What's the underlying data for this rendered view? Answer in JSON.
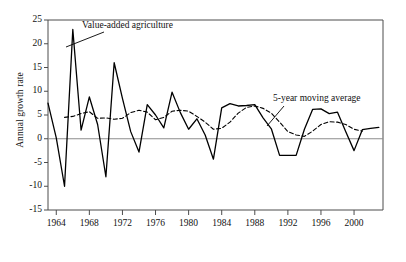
{
  "chart_data": {
    "type": "line",
    "title": "",
    "xlabel": "",
    "ylabel": "Annual growth rate",
    "xlim": [
      1963,
      2003.5
    ],
    "ylim": [
      -15,
      25
    ],
    "yticks": [
      25,
      20,
      15,
      10,
      5,
      0,
      -5,
      -10,
      -15
    ],
    "xticks": [
      1964,
      1968,
      1972,
      1976,
      1980,
      1984,
      1988,
      1992,
      1996,
      2000
    ],
    "grid": false,
    "legend_position": "inline-annotations",
    "zero_line": 0,
    "annotations": [
      {
        "text": "Value-added agriculture",
        "x": 1969.2,
        "y": 21.0
      },
      {
        "text": "5-year moving average",
        "x": 1992.5,
        "y": 9.8
      }
    ],
    "series": [
      {
        "name": "Value-added agriculture",
        "style": "solid",
        "color": "#000000",
        "x": [
          1963,
          1964,
          1965,
          1966,
          1967,
          1968,
          1969,
          1970,
          1971,
          1972,
          1973,
          1974,
          1975,
          1976,
          1977,
          1978,
          1979,
          1980,
          1981,
          1982,
          1983,
          1984,
          1985,
          1986,
          1987,
          1988,
          1989,
          1990,
          1991,
          1992,
          1993,
          1994,
          1995,
          1996,
          1997,
          1998,
          1999,
          2000,
          2001,
          2002,
          2003
        ],
        "y": [
          7.5,
          0.2,
          -10.0,
          23.0,
          1.8,
          8.8,
          3.0,
          -8.0,
          16.0,
          8.5,
          1.5,
          -2.8,
          7.2,
          5.0,
          2.3,
          9.8,
          5.5,
          2.0,
          4.2,
          0.8,
          -4.3,
          6.5,
          7.4,
          6.9,
          7.0,
          7.2,
          4.4,
          2.1,
          -3.5,
          -3.5,
          -3.5,
          2.0,
          6.2,
          6.3,
          5.3,
          5.6,
          1.5,
          -2.5,
          1.9,
          2.2,
          2.4
        ]
      },
      {
        "name": "5-year moving average",
        "style": "dashed",
        "color": "#000000",
        "x": [
          1965,
          1966,
          1967,
          1968,
          1969,
          1970,
          1971,
          1972,
          1973,
          1974,
          1975,
          1976,
          1977,
          1978,
          1979,
          1980,
          1981,
          1982,
          1983,
          1984,
          1985,
          1986,
          1987,
          1988,
          1989,
          1990,
          1991,
          1992,
          1993,
          1994,
          1995,
          1996,
          1997,
          1998,
          1999,
          2000,
          2001
        ],
        "y": [
          4.5,
          4.7,
          5.3,
          5.7,
          4.3,
          4.4,
          4.1,
          4.3,
          5.5,
          6.0,
          5.6,
          4.0,
          4.5,
          5.8,
          6.0,
          5.8,
          4.7,
          3.5,
          2.0,
          2.2,
          3.5,
          5.4,
          6.6,
          6.9,
          6.4,
          5.4,
          3.5,
          1.5,
          0.8,
          0.5,
          1.6,
          3.0,
          3.6,
          3.5,
          3.0,
          2.0,
          1.6
        ]
      }
    ]
  },
  "axis": {
    "ylabel": "Annual growth rate",
    "ytick_labels": [
      "25",
      "20",
      "15",
      "10",
      "5",
      "0",
      "-5",
      "-10",
      "-15"
    ],
    "xtick_labels": [
      "1964",
      "1968",
      "1972",
      "1976",
      "1980",
      "1984",
      "1988",
      "1992",
      "1996",
      "2000"
    ]
  },
  "annotations": {
    "series1_label": "Value-added agriculture",
    "series2_label": "5-year moving average"
  },
  "colors": {
    "line": "#000000",
    "axis": "#4d4d4d",
    "zero_line": "#8c8c8c",
    "background": "#ffffff"
  }
}
